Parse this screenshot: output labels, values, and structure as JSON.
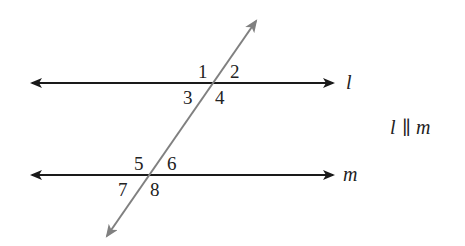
{
  "diagram": {
    "lines": {
      "l": {
        "label": "l",
        "y": 83
      },
      "m": {
        "label": "m",
        "y": 175
      }
    },
    "transversal": {
      "color": "#808080"
    },
    "angles": [
      "1",
      "2",
      "3",
      "4",
      "5",
      "6",
      "7",
      "8"
    ],
    "statement": "l ∥ m",
    "statement_parts": {
      "left": "l",
      "symbol": "∥",
      "right": "m"
    },
    "colors": {
      "parallel_lines": "#1a1a1a",
      "transversal": "#808080"
    }
  }
}
